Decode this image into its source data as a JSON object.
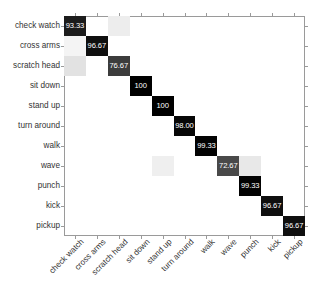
{
  "chart_data": {
    "type": "heatmap",
    "title": "",
    "xlabel": "",
    "ylabel": "",
    "legend": "none",
    "grid": false,
    "value_format": "percent",
    "categories": [
      "check watch",
      "cross arms",
      "scratch head",
      "sit down",
      "stand up",
      "turn around",
      "walk",
      "wave",
      "punch",
      "kick",
      "pickup"
    ],
    "x_tick_labels": [
      "check watch",
      "cross arms",
      "scratch head",
      "sit down",
      "stand up",
      "turn around",
      "walk",
      "wave",
      "punch",
      "kick",
      "pickup"
    ],
    "y_tick_labels": [
      "check watch",
      "cross arms",
      "scratch head",
      "sit down",
      "stand up",
      "turn around",
      "walk",
      "wave",
      "punch",
      "kick",
      "pickup"
    ],
    "diagonal_values": [
      "93.33",
      "96.67",
      "76.67",
      "100",
      "100",
      "98.00",
      "99.33",
      "72.67",
      "99.33",
      "96.67",
      "96.67"
    ],
    "zlim": [
      0,
      100
    ],
    "colormap": "gray_reversed",
    "cells": [
      {
        "row": 0,
        "col": 0,
        "value": 93.33,
        "label": "93.33",
        "shade": "#1c1c1c",
        "text": "light"
      },
      {
        "row": 0,
        "col": 2,
        "value": 6.67,
        "label": "",
        "shade": "#ededed",
        "text": "dark"
      },
      {
        "row": 1,
        "col": 1,
        "value": 96.67,
        "label": "96.67",
        "shade": "#0f0f0f",
        "text": "light"
      },
      {
        "row": 1,
        "col": 0,
        "value": 3.33,
        "label": "",
        "shade": "#f4f4f4",
        "text": "dark"
      },
      {
        "row": 2,
        "col": 2,
        "value": 76.67,
        "label": "76.67",
        "shade": "#3c3c3c",
        "text": "light"
      },
      {
        "row": 2,
        "col": 0,
        "value": 23.33,
        "label": "",
        "shade": "#e2e2e2",
        "text": "dark"
      },
      {
        "row": 3,
        "col": 3,
        "value": 100,
        "label": "100",
        "shade": "#000000",
        "text": "light"
      },
      {
        "row": 4,
        "col": 4,
        "value": 100,
        "label": "100",
        "shade": "#000000",
        "text": "light"
      },
      {
        "row": 5,
        "col": 5,
        "value": 98.0,
        "label": "98.00",
        "shade": "#070707",
        "text": "light"
      },
      {
        "row": 6,
        "col": 6,
        "value": 99.33,
        "label": "99.33",
        "shade": "#030303",
        "text": "light"
      },
      {
        "row": 7,
        "col": 7,
        "value": 72.67,
        "label": "72.67",
        "shade": "#494949",
        "text": "light"
      },
      {
        "row": 7,
        "col": 8,
        "value": 20.0,
        "label": "",
        "shade": "#e8e8e8",
        "text": "dark"
      },
      {
        "row": 7,
        "col": 4,
        "value": 6.67,
        "label": "",
        "shade": "#efefef",
        "text": "dark"
      },
      {
        "row": 8,
        "col": 8,
        "value": 99.33,
        "label": "99.33",
        "shade": "#030303",
        "text": "light"
      },
      {
        "row": 9,
        "col": 9,
        "value": 96.67,
        "label": "96.67",
        "shade": "#0f0f0f",
        "text": "light"
      },
      {
        "row": 10,
        "col": 10,
        "value": 96.67,
        "label": "96.67",
        "shade": "#0f0f0f",
        "text": "light"
      }
    ],
    "axis": {
      "left_px": 64,
      "top_px": 16,
      "width_px": 241,
      "height_px": 220,
      "n": 11
    }
  }
}
